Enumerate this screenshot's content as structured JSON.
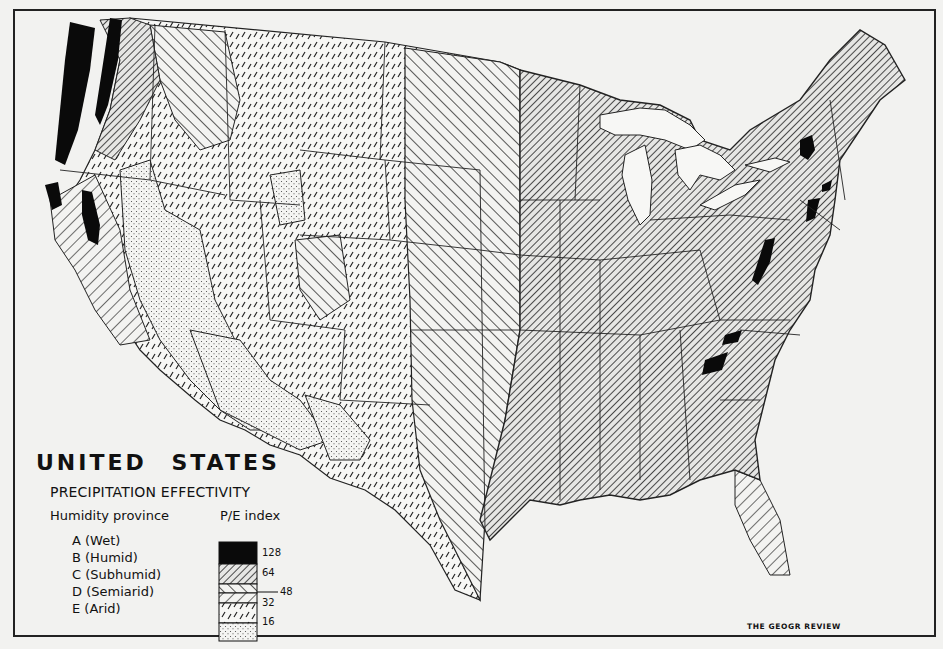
{
  "figure": {
    "title": "UNITED STATES",
    "subtitle": "PRECIPITATION EFFECTIVITY",
    "credit": "THE GEOGR REVIEW",
    "colors": {
      "background": "#f2f2f0",
      "ink": "#111111",
      "wet_fill": "#0a0a0a",
      "land_light": "#f7f7f5"
    }
  },
  "legend": {
    "col_left_header": "Humidity province",
    "col_right_header": "P/E index",
    "classes": [
      {
        "code": "A",
        "label": "A (Wet)",
        "pattern": "solid-black"
      },
      {
        "code": "B",
        "label": "B (Humid)",
        "pattern": "dense-diagonal-hatch"
      },
      {
        "code": "C",
        "label": "C (Subhumid)",
        "pattern": "wide-back-diagonal-hatch"
      },
      {
        "code": "D",
        "label": "D (Semiarid)",
        "pattern": "dashed-slashes"
      },
      {
        "code": "E",
        "label": "E (Arid)",
        "pattern": "stipple-dots"
      }
    ],
    "index_breaks": [
      "128",
      "64",
      "48",
      "32",
      "16"
    ]
  },
  "map": {
    "region": "Contiguous United States",
    "features": [
      "state-boundaries",
      "great-lakes",
      "humidity-province-zones"
    ]
  }
}
